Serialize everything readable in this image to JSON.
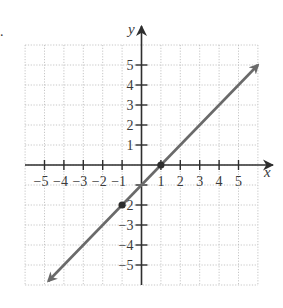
{
  "chart_data": {
    "type": "line",
    "title": "",
    "xlabel": "x",
    "ylabel": "y",
    "xlim": [
      -6,
      6
    ],
    "ylim": [
      -6,
      6
    ],
    "grid": true,
    "x_ticks": [
      -5,
      -4,
      -3,
      -2,
      -1,
      1,
      2,
      3,
      4,
      5
    ],
    "y_ticks": [
      -5,
      -4,
      -3,
      -2,
      -1,
      1,
      2,
      3,
      4,
      5
    ],
    "x_tick_labels": [
      "−5",
      "−4",
      "−3",
      "−2",
      "−1",
      "1",
      "2",
      "3",
      "4",
      "5"
    ],
    "y_tick_labels": [
      "−5",
      "−4",
      "−3",
      "−2",
      "−1",
      "1",
      "2",
      "3",
      "4",
      "5"
    ],
    "series": [
      {
        "name": "line",
        "equation": "y = x - 1",
        "x": [
          -4.8,
          6
        ],
        "y": [
          -5.8,
          5
        ],
        "arrows": "both",
        "color": "#6a6a6a"
      }
    ],
    "points": [
      {
        "x": 1,
        "y": 0
      },
      {
        "x": -1,
        "y": -2
      }
    ],
    "legend": null
  },
  "labels": {
    "x_axis": "x",
    "y_axis": "y",
    "exercise_marker": "."
  },
  "colors": {
    "axis": "#2e2e2e",
    "grid": "#b8b8b8",
    "line": "#6a6a6a",
    "text": "#3a3a3a"
  }
}
